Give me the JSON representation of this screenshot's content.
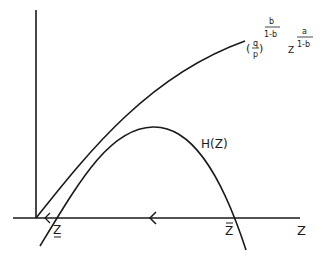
{
  "diagram": {
    "axes": {
      "x_label": "Z",
      "y_label": ""
    },
    "curves": {
      "upper": {
        "label_base_num": "q",
        "label_base_den": "p",
        "label_exp1_num": "b",
        "label_exp1_den": "1-b",
        "label_var": "Z",
        "label_exp2_num": "a",
        "label_exp2_den": "1-b"
      },
      "lower": {
        "label": "H(Z)"
      }
    },
    "points": {
      "lower_root": "Z",
      "upper_root": "Z"
    },
    "arrow_direction": "<",
    "colors": {
      "ink": "#1a1a1a",
      "background": "#ffffff"
    }
  }
}
